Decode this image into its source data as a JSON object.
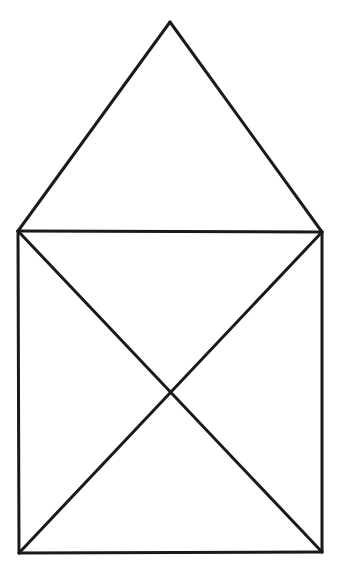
{
  "page": {
    "title": "Geometric Line Figure",
    "background_color": "#ffffff",
    "width": 349,
    "height": 587
  },
  "figure": {
    "name": "house-with-crossed-square",
    "stroke_color": "#1a1a1a",
    "stroke_width": 3,
    "fill": "none",
    "points": {
      "apex": {
        "label": "apex",
        "x": 170,
        "y": 22
      },
      "top_left": {
        "label": "top-left",
        "x": 18,
        "y": 231
      },
      "top_right": {
        "label": "top-right",
        "x": 322,
        "y": 232
      },
      "bottom_left": {
        "label": "bottom-left",
        "x": 19,
        "y": 553
      },
      "bottom_right": {
        "label": "bottom-right",
        "x": 322,
        "y": 552
      },
      "center": {
        "label": "diagonal-crossing",
        "x": 170,
        "y": 392
      }
    },
    "segments": [
      {
        "name": "roof-left-edge",
        "from": "apex",
        "to": "top_left",
        "d": "M 170 22 L 18 231"
      },
      {
        "name": "roof-right-edge",
        "from": "apex",
        "to": "top_right",
        "d": "M 170 22 L 322 232"
      },
      {
        "name": "square-top-edge",
        "from": "top_left",
        "to": "top_right",
        "d": "M 18 231 L 322 232"
      },
      {
        "name": "square-left-edge",
        "from": "top_left",
        "to": "bottom_left",
        "d": "M 18 231 L 19 553"
      },
      {
        "name": "square-right-edge",
        "from": "top_right",
        "to": "bottom_right",
        "d": "M 322 232 L 322 552"
      },
      {
        "name": "square-bottom-edge",
        "from": "bottom_left",
        "to": "bottom_right",
        "d": "M 19 553 L 322 552"
      },
      {
        "name": "diagonal-tl-br",
        "from": "top_left",
        "to": "bottom_right",
        "d": "M 18 231 L 322 552"
      },
      {
        "name": "diagonal-tr-bl",
        "from": "top_right",
        "to": "bottom_left",
        "d": "M 322 232 L 19 553"
      }
    ]
  }
}
